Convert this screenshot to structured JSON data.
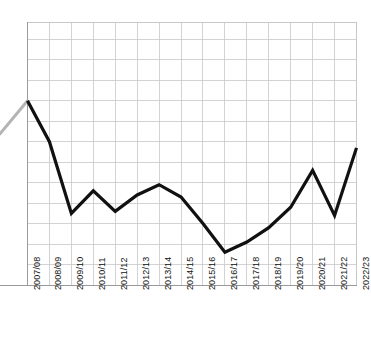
{
  "chart_data": {
    "type": "line",
    "title": "",
    "subtitle": "",
    "xlabel": "",
    "ylabel": "",
    "categories": [
      "2007/08",
      "2008/09",
      "2009/10",
      "2010/11",
      "2011/12",
      "2012/13",
      "2013/14",
      "2014/15",
      "2015/16",
      "2016/17",
      "2017/18",
      "2018/19",
      "2019/20",
      "2020/21",
      "2021/22",
      "2022/23"
    ],
    "values": [
      9.0,
      7.0,
      3.5,
      4.6,
      3.6,
      4.4,
      4.9,
      4.3,
      3.0,
      1.6,
      2.1,
      2.8,
      3.8,
      5.6,
      3.4,
      6.7
    ],
    "ylim": [
      0,
      12.85
    ],
    "yticks": [
      0,
      1,
      2,
      3,
      4,
      5,
      6,
      7,
      8,
      9,
      10,
      11,
      12
    ],
    "ytick_labels": [],
    "grid": true,
    "legend": "none",
    "series": [
      {
        "name": "series-1",
        "color": "#111111",
        "values": [
          9.0,
          7.0,
          3.5,
          4.6,
          3.6,
          4.4,
          4.9,
          4.3,
          3.0,
          1.6,
          2.1,
          2.8,
          3.8,
          5.6,
          3.4,
          6.7
        ]
      }
    ],
    "annotations": [
      {
        "name": "leading-grey-stub",
        "description": "faint grey line segment entering the frame from the left edge toward the first data point",
        "color": "#b4b4b4"
      }
    ]
  },
  "colors": {
    "line": "#111111",
    "grid": "#c8c8c8",
    "axis": "#9a9a9a",
    "background": "#ffffff",
    "tick_text": "#141414",
    "stub": "#b4b4b4"
  },
  "axis": {
    "x_tick_count": 16
  }
}
